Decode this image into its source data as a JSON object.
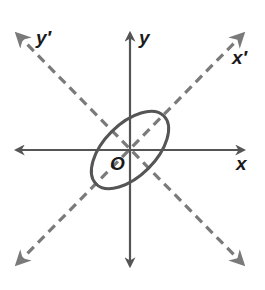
{
  "diagram": {
    "labels": {
      "x": "x",
      "y": "y",
      "x_prime": "x′",
      "y_prime": "y′",
      "origin": "O"
    },
    "colors": {
      "axis": "#555555",
      "dashed_axis": "#7a7a7a",
      "ellipse": "#555555",
      "label": "#1a1a1a",
      "background": "#ffffff"
    },
    "elements": {
      "x_axis": {
        "style": "solid",
        "arrows": "both"
      },
      "y_axis": {
        "style": "solid",
        "arrows": "both"
      },
      "x_prime_axis": {
        "style": "dashed",
        "arrows": "both",
        "angle_deg": 45
      },
      "y_prime_axis": {
        "style": "dashed",
        "arrows": "both",
        "angle_deg": 135
      },
      "ellipse": {
        "center": "O",
        "major_axis_along": "x′",
        "rotation_deg": 45
      }
    }
  }
}
